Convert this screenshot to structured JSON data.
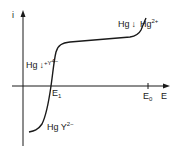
{
  "diagram": {
    "type": "polarographic current-potential curve",
    "axes": {
      "y_label": "i",
      "x_label": "E"
    },
    "ticks": {
      "e1": "E",
      "e1_sub": "1",
      "e0": "E",
      "e0_sub": "0"
    },
    "annotations": {
      "upper_left": {
        "base": "Hg",
        "arrow": "↓",
        "extra": "+Y",
        "sup": "4−"
      },
      "upper_right": {
        "base": "Hg",
        "arrow": "↓",
        "extra": "Hg",
        "sup": "2+"
      },
      "lower": {
        "base": "Hg Y",
        "sup": "2−"
      }
    },
    "colors": {
      "line": "#1a1a1a",
      "background": "#ffffff"
    }
  }
}
